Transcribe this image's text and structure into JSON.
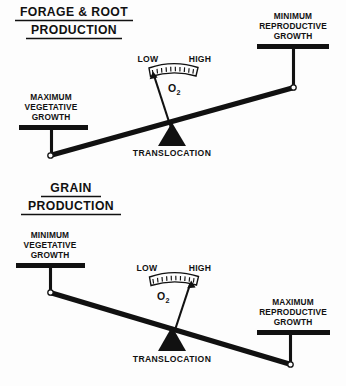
{
  "document": {
    "kind": "diagram",
    "subject": "Plant carbohydrate translocation balance diagram",
    "background_color": "#fdfdfd",
    "ink_color": "#111111"
  },
  "panels": [
    {
      "id": "forage-root",
      "title_lines": [
        "FORAGE & ROOT",
        "PRODUCTION"
      ],
      "title_underlined": true,
      "left_platform": {
        "label_lines": [
          "MAXIMUM",
          "VEGETATIVE",
          "GROWTH"
        ],
        "position": "down"
      },
      "right_platform": {
        "label_lines": [
          "MINIMUM",
          "REPRODUCTIVE",
          "GROWTH"
        ],
        "position": "up"
      },
      "fulcrum_label": "TRANSLOCATION",
      "gauge": {
        "low_label": "LOW",
        "high_label": "HIGH",
        "measure_label": "O",
        "measure_subscript": "2",
        "needle_points_to": "LOW",
        "tick_count": 11
      },
      "beam_tilt": "left-side-down"
    },
    {
      "id": "grain",
      "title_lines": [
        "GRAIN",
        "PRODUCTION"
      ],
      "title_underlined": true,
      "left_platform": {
        "label_lines": [
          "MINIMUM",
          "VEGETATIVE",
          "GROWTH"
        ],
        "position": "up"
      },
      "right_platform": {
        "label_lines": [
          "MAXIMUM",
          "REPRODUCTIVE",
          "GROWTH"
        ],
        "position": "down"
      },
      "fulcrum_label": "TRANSLOCATION",
      "gauge": {
        "low_label": "LOW",
        "high_label": "HIGH",
        "measure_label": "O",
        "measure_subscript": "2",
        "needle_points_to": "HIGH",
        "tick_count": 11
      },
      "beam_tilt": "right-side-down"
    }
  ]
}
